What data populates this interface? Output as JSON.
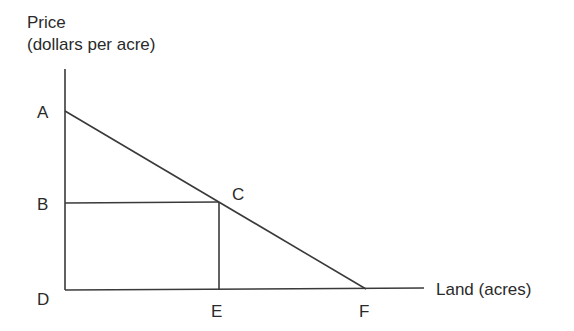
{
  "diagram": {
    "type": "demand-curve-land-rent",
    "y_axis_label_line1": "Price",
    "y_axis_label_line2": "(dollars per acre)",
    "x_axis_label": "Land (acres)",
    "points": {
      "A": {
        "label": "A",
        "x": 65,
        "y": 111
      },
      "B": {
        "label": "B",
        "x": 65,
        "y": 203
      },
      "C": {
        "label": "C",
        "x": 219,
        "y": 203
      },
      "D": {
        "label": "D",
        "x": 65,
        "y": 290
      },
      "E": {
        "label": "E",
        "x": 219,
        "y": 290
      },
      "F": {
        "label": "F",
        "x": 366,
        "y": 289
      }
    },
    "line_color": "#3a3a3a"
  }
}
